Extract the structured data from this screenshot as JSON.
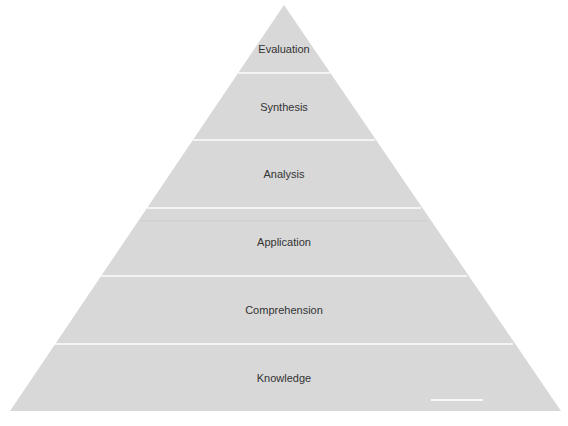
{
  "diagram": {
    "type": "pyramid",
    "colors": {
      "fill": "#d8d8d8",
      "separator": "#f4f4f4",
      "text": "#333333",
      "background": "#ffffff"
    },
    "levels": [
      {
        "label": "Evaluation"
      },
      {
        "label": "Synthesis"
      },
      {
        "label": "Analysis"
      },
      {
        "label": "Application"
      },
      {
        "label": "Comprehension"
      },
      {
        "label": "Knowledge"
      }
    ]
  }
}
